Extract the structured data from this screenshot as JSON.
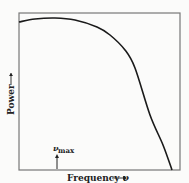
{
  "chart_data": {
    "type": "line",
    "title": "",
    "xlabel": "Frequency ν",
    "ylabel": "Power",
    "x_arrow": "→",
    "y_arrow": "→",
    "annotation": {
      "text": "ν",
      "subscript": "max",
      "marker": "up-arrow"
    },
    "ticks": {
      "x": [],
      "y": []
    },
    "grid": false,
    "legend": null,
    "series": [
      {
        "name": "power spectrum",
        "points_px": [
          [
            19,
            22
          ],
          [
            35,
            19
          ],
          [
            55,
            18
          ],
          [
            75,
            20
          ],
          [
            97,
            27
          ],
          [
            110,
            35
          ],
          [
            125,
            50
          ],
          [
            135,
            68
          ],
          [
            150,
            115
          ],
          [
            163,
            145
          ],
          [
            172,
            170
          ]
        ]
      }
    ]
  },
  "labels": {
    "ylabel": "Power",
    "xlabel": "Frequency ν",
    "nu": "ν",
    "max": "max"
  },
  "colors": {
    "line": "#1a1a1a",
    "frame": "#777777",
    "bg": "#fbfbfa"
  }
}
